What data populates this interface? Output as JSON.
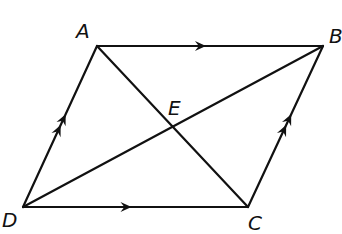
{
  "diagram": {
    "type": "parallelogram",
    "points": {
      "A": {
        "label": "A",
        "x": 97,
        "y": 46,
        "label_x": 76,
        "label_y": 38
      },
      "B": {
        "label": "B",
        "x": 323,
        "y": 46,
        "label_x": 329,
        "label_y": 43
      },
      "C": {
        "label": "C",
        "x": 248,
        "y": 207,
        "label_x": 248,
        "label_y": 230
      },
      "D": {
        "label": "D",
        "x": 23,
        "y": 207,
        "label_x": 2,
        "label_y": 227
      },
      "E": {
        "label": "E",
        "x": 171,
        "y": 126,
        "label_x": 168,
        "label_y": 115
      }
    },
    "segments": [
      {
        "name": "side-ab",
        "from": "A",
        "to": "B",
        "marks": "single-arrow"
      },
      {
        "name": "side-dc",
        "from": "D",
        "to": "C",
        "marks": "single-arrow"
      },
      {
        "name": "side-da",
        "from": "D",
        "to": "A",
        "marks": "double-arrow"
      },
      {
        "name": "side-cb",
        "from": "C",
        "to": "B",
        "marks": "double-arrow"
      },
      {
        "name": "diagonal-ac",
        "from": "A",
        "to": "C",
        "marks": "none"
      },
      {
        "name": "diagonal-db",
        "from": "D",
        "to": "B",
        "marks": "none"
      }
    ],
    "stroke_color": "#111111",
    "background_color": "#ffffff"
  }
}
